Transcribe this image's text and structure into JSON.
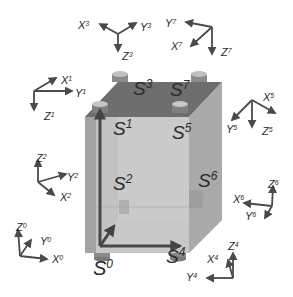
{
  "colors": {
    "background": "#ffffff",
    "axis": "#4a4a4a",
    "label": "#2b2b2b",
    "cube_top": "#6f6f6f",
    "cube_front": "#c4c4c4",
    "cube_side": "#a9a9a9",
    "cube_left": "#9c9c9c",
    "cube_bottom": "#d6d6d6",
    "inner_axis": "#4b4b4b",
    "cap": "#bdbdbd",
    "cap_side": "#8a8a8a"
  },
  "sensors": [
    {
      "id": "s0",
      "base": "S",
      "sup": "0",
      "x": 93,
      "y": 275,
      "size": 20
    },
    {
      "id": "s1",
      "base": "S",
      "sup": "1",
      "x": 113,
      "y": 135,
      "size": 19
    },
    {
      "id": "s2",
      "base": "S",
      "sup": "2",
      "x": 113,
      "y": 190,
      "size": 19
    },
    {
      "id": "s3",
      "base": "S",
      "sup": "3",
      "x": 133,
      "y": 95,
      "size": 19
    },
    {
      "id": "s4",
      "base": "S",
      "sup": "4",
      "x": 166,
      "y": 263,
      "size": 19
    },
    {
      "id": "s5",
      "base": "S",
      "sup": "5",
      "x": 172,
      "y": 139,
      "size": 19
    },
    {
      "id": "s6",
      "base": "S",
      "sup": "6",
      "x": 198,
      "y": 187,
      "size": 19
    },
    {
      "id": "s7",
      "base": "S",
      "sup": "7",
      "x": 170,
      "y": 96,
      "size": 19
    }
  ],
  "frames": [
    {
      "id": "frame-3",
      "origin": [
        118,
        34
      ],
      "axes": [
        {
          "name": "X",
          "sup": "3",
          "to": [
            100,
            24
          ],
          "lx": 78,
          "ly": 29
        },
        {
          "name": "Y",
          "sup": "3",
          "to": [
            136,
            23
          ],
          "lx": 140,
          "ly": 31
        },
        {
          "name": "Z",
          "sup": "3",
          "to": [
            118,
            51
          ],
          "lx": 122,
          "ly": 60
        }
      ]
    },
    {
      "id": "frame-7",
      "origin": [
        212,
        27
      ],
      "axes": [
        {
          "name": "Y",
          "sup": "7",
          "to": [
            186,
            22
          ],
          "lx": 165,
          "ly": 27
        },
        {
          "name": "X",
          "sup": "7",
          "to": [
            191,
            46
          ],
          "lx": 171,
          "ly": 50
        },
        {
          "name": "Z",
          "sup": "7",
          "to": [
            212,
            54
          ],
          "lx": 221,
          "ly": 56
        }
      ]
    },
    {
      "id": "frame-1",
      "origin": [
        34,
        91
      ],
      "axes": [
        {
          "name": "X",
          "sup": "1",
          "to": [
            56,
            78
          ],
          "lx": 61,
          "ly": 84
        },
        {
          "name": "Y",
          "sup": "1",
          "to": [
            72,
            91
          ],
          "lx": 75,
          "ly": 97
        },
        {
          "name": "Z",
          "sup": "1",
          "to": [
            34,
            110
          ],
          "lx": 44,
          "ly": 120
        }
      ]
    },
    {
      "id": "frame-5",
      "origin": [
        252,
        100
      ],
      "axes": [
        {
          "name": "X",
          "sup": "5",
          "to": [
            275,
            113
          ],
          "lx": 263,
          "ly": 101
        },
        {
          "name": "Y",
          "sup": "5",
          "to": [
            232,
            120
          ],
          "lx": 226,
          "ly": 133
        },
        {
          "name": "Z",
          "sup": "5",
          "to": [
            252,
            127
          ],
          "lx": 262,
          "ly": 135
        }
      ]
    },
    {
      "id": "frame-2",
      "origin": [
        38,
        182
      ],
      "axes": [
        {
          "name": "Z",
          "sup": "2",
          "to": [
            38,
            160
          ],
          "lx": 36,
          "ly": 162
        },
        {
          "name": "Y",
          "sup": "2",
          "to": [
            66,
            174
          ],
          "lx": 67,
          "ly": 181
        },
        {
          "name": "X",
          "sup": "2",
          "to": [
            54,
            195
          ],
          "lx": 60,
          "ly": 201
        }
      ]
    },
    {
      "id": "frame-0",
      "origin": [
        20,
        256
      ],
      "axes": [
        {
          "name": "Z",
          "sup": "0",
          "to": [
            18,
            230
          ],
          "lx": 16,
          "ly": 231
        },
        {
          "name": "Y",
          "sup": "0",
          "to": [
            31,
            240
          ],
          "lx": 40,
          "ly": 245
        },
        {
          "name": "X",
          "sup": "0",
          "to": [
            47,
            259
          ],
          "lx": 52,
          "ly": 263
        }
      ]
    },
    {
      "id": "frame-6",
      "origin": [
        272,
        206
      ],
      "axes": [
        {
          "name": "Z",
          "sup": "6",
          "to": [
            273,
            186
          ],
          "lx": 268,
          "ly": 188
        },
        {
          "name": "X",
          "sup": "6",
          "to": [
            244,
            203
          ],
          "lx": 233,
          "ly": 203
        },
        {
          "name": "Y",
          "sup": "6",
          "to": [
            265,
            218
          ],
          "lx": 245,
          "ly": 220
        }
      ]
    },
    {
      "id": "frame-4",
      "origin": [
        233,
        278
      ],
      "axes": [
        {
          "name": "Z",
          "sup": "4",
          "to": [
            233,
            253
          ],
          "lx": 228,
          "ly": 250
        },
        {
          "name": "X",
          "sup": "4",
          "to": [
            228,
            260
          ],
          "lx": 207,
          "ly": 263
        },
        {
          "name": "Y",
          "sup": "4",
          "to": [
            207,
            278
          ],
          "lx": 186,
          "ly": 281
        }
      ]
    }
  ]
}
